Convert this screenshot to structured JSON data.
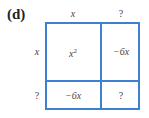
{
  "figure": {
    "part_label": "(d)",
    "grid_color": "#3f7fd0",
    "column_headers": [
      "x",
      "?"
    ],
    "row_headers": [
      "x",
      "?"
    ],
    "cells": [
      [
        {
          "base": "x",
          "sup": "2"
        },
        {
          "text": "−6x"
        }
      ],
      [
        {
          "text": "−6x"
        },
        {
          "text": "?"
        }
      ]
    ]
  }
}
